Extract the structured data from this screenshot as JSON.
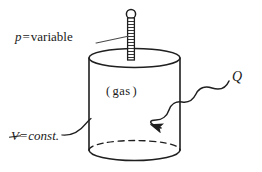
{
  "figure": {
    "caption": "",
    "background_color": "#ffffff",
    "ink_color": "#1a1a1a"
  },
  "labels": {
    "pressure": {
      "symbol": "p",
      "equals": "=",
      "value": "variable",
      "full_text": "p = variable"
    },
    "volume": {
      "symbol": "V",
      "symbol_note": "V-with-slash (volume symbol)",
      "equals": "=",
      "value": "const.",
      "full_text": "V = const."
    },
    "contents": {
      "open_paren": "(",
      "text": "gas",
      "close_paren": ")",
      "full_text": "( gas )"
    },
    "heat": {
      "symbol": "Q",
      "full_text": "Q",
      "meaning": "heat-transfer"
    }
  },
  "elements": {
    "cylinder": {
      "name": "rigid-vessel",
      "left_x": 89,
      "right_x": 180,
      "top_center_y": 58,
      "bottom_center_y": 150,
      "ellipse_rx": 45.5,
      "ellipse_ry": 9.5
    },
    "piston_rod": {
      "name": "piston-rod",
      "center_x": 131,
      "knob_center_y": 14,
      "knob_radius": 5,
      "shaft_top_y": 19,
      "shaft_bottom_y": 60,
      "shaft_width": 7,
      "hatch_count": 13
    },
    "heat_arrow": {
      "name": "wavy-heat-arrow",
      "from": [
        229,
        81
      ],
      "to": [
        160,
        128
      ],
      "style": "sinusoidal",
      "arrowhead": "left-pointing"
    },
    "volume_leader": {
      "name": "volume-leader-line",
      "from": [
        62,
        134
      ],
      "to": [
        93,
        119
      ]
    },
    "pressure_leader": {
      "name": "pressure-leader-line",
      "from": [
        97,
        42
      ],
      "to": [
        131,
        36
      ]
    }
  },
  "colors": {
    "stroke": "#1f1f1f",
    "background": "#ffffff",
    "text": "#1a1a1a"
  }
}
